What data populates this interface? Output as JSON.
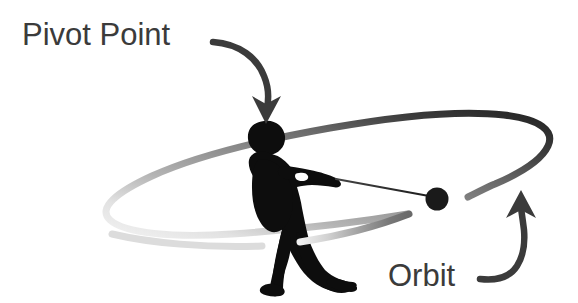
{
  "figure": {
    "background_color": "#ffffff",
    "width": 578,
    "height": 303
  },
  "labels": {
    "pivot_point": {
      "text": "Pivot Point",
      "color": "#3b3b3b",
      "font_size_px": 30,
      "x": 22,
      "y": 45
    },
    "orbit": {
      "text": "Orbit",
      "color": "#3b3b3b",
      "font_size_px": 30,
      "x": 388,
      "y": 285
    }
  },
  "annotations": {
    "pivot_arrow": {
      "name": "pivot-point-arrow",
      "color": "#3b3b3b",
      "description": "curved arrow from end of Pivot Point text down to the athlete's head",
      "points_to": "athlete-head"
    },
    "orbit_arrow": {
      "name": "orbit-arrow",
      "color": "#3b3b3b",
      "description": "curved arrow from Orbit text sweeping right and up to the dark orbit ellipse",
      "points_to": "orbit-ellipse"
    }
  },
  "scene": {
    "orbit_ellipse": {
      "name": "orbit-ellipse",
      "center_x": 336,
      "center_y": 185,
      "radius_x": 230,
      "radius_y": 62,
      "rotation_deg": -11,
      "stroke_width": 7,
      "gradient": {
        "light": "#efefef",
        "mid": "#8d8d8d",
        "dark": "#2a2a2a"
      },
      "gap_description": "break in the stroke at the lower-right, between the hammer ball and the dark upper-right arc"
    },
    "athlete": {
      "name": "athlete-silhouette",
      "color": "#0d0d0d",
      "pose": "hammer thrower winding, leaning back, arms extended to the right",
      "head_x": 266,
      "head_y": 135
    },
    "hammer_ball": {
      "name": "hammer-ball",
      "color": "#1a1a1a",
      "center_x": 437,
      "center_y": 199,
      "radius": 11
    },
    "hammer_wire": {
      "name": "hammer-wire",
      "color": "#2b2b2b",
      "from_x": 337,
      "from_y": 179,
      "to_x": 428,
      "to_y": 197,
      "stroke_width": 2
    }
  }
}
